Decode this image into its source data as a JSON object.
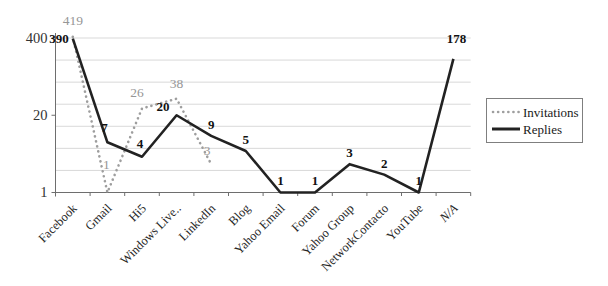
{
  "chart_data": {
    "type": "line",
    "categories": [
      "Facebook",
      "Gmail",
      "Hi5",
      "Windows Live..",
      "LinkedIn",
      "Blog",
      "Yahoo Email",
      "Forum",
      "Yahoo Group",
      "NetworkContacto",
      "YouTube",
      "N/A"
    ],
    "series": [
      {
        "name": "Invitations",
        "values": [
          419,
          1,
          26,
          38,
          3,
          null,
          null,
          null,
          null,
          null,
          null,
          null
        ],
        "line_style": "dotted",
        "color": "#9e9e9e",
        "label_color": "#969696",
        "label_bold": false
      },
      {
        "name": "Replies",
        "values": [
          390,
          7,
          4,
          20,
          9,
          5,
          1,
          1,
          3,
          2,
          1,
          178
        ],
        "line_style": "solid",
        "color": "#222222",
        "label_color": "#111111",
        "label_bold": true
      }
    ],
    "title": "",
    "xlabel": "",
    "ylabel": "",
    "yscale": "log",
    "ylim": [
      1,
      400
    ],
    "yticks": [
      400,
      20,
      1
    ],
    "grid": true,
    "gridline_color": "#d9d9d9",
    "axis_color": "#6e6e6e",
    "tick_label_color": "#333333",
    "legend": {
      "position": "right",
      "entries": [
        {
          "label": "Invitations",
          "style": "dotted",
          "color": "#9e9e9e"
        },
        {
          "label": "Replies",
          "style": "solid",
          "color": "#222222"
        }
      ]
    }
  }
}
